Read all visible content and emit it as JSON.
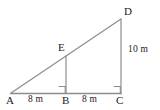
{
  "figure": {
    "kind": "geometry-diagram",
    "stroke_color": "#8c8c8c",
    "text_color": "#1a1a1a",
    "background_color": "#ffffff",
    "vertices": {
      "A": {
        "label": "A",
        "x": 11,
        "y": 93
      },
      "B": {
        "label": "B",
        "x": 66,
        "y": 93
      },
      "C": {
        "label": "C",
        "x": 121,
        "y": 93
      },
      "D": {
        "label": "D",
        "x": 121,
        "y": 19
      },
      "E": {
        "label": "E",
        "x": 66,
        "y": 56
      }
    },
    "segments": [
      {
        "name": "base-AC",
        "from": "A",
        "to": "C"
      },
      {
        "name": "hypotenuse-AD",
        "from": "A",
        "to": "D"
      },
      {
        "name": "vertical-DC",
        "from": "D",
        "to": "C"
      },
      {
        "name": "vertical-EB",
        "from": "E",
        "to": "B"
      }
    ],
    "right_angle_markers": [
      {
        "name": "right-angle-at-B",
        "at": "B"
      },
      {
        "name": "right-angle-at-C",
        "at": "C"
      }
    ],
    "measures": {
      "segment_AB": "8 m",
      "segment_BC": "8 m",
      "segment_DC": "10 m"
    }
  }
}
